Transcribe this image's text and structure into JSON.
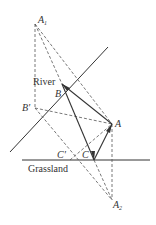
{
  "diagram": {
    "labels": {
      "A1": "A",
      "A1_sub": "1",
      "A2": "A",
      "A2_sub": "2",
      "A": "A",
      "B": "B",
      "B_prime": "B'",
      "C": "C",
      "C_prime": "C'",
      "river": "River",
      "grassland": "Grassland"
    },
    "points": {
      "A1": [
        35,
        24
      ],
      "B": [
        62,
        84
      ],
      "B_prime": [
        35,
        108
      ],
      "A": [
        112,
        124
      ],
      "C_prime": [
        70,
        160
      ],
      "C": [
        94,
        160
      ],
      "A2": [
        112,
        200
      ]
    },
    "colors": {
      "line": "#333333",
      "background": "#ffffff"
    }
  }
}
